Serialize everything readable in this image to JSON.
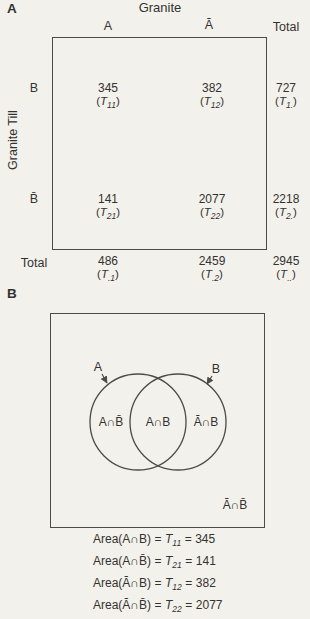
{
  "colors": {
    "paper": "#f3f1ec",
    "ink": "#343230",
    "line": "#4e4b46"
  },
  "panelA": {
    "label": "A",
    "title": "Granite",
    "col_headers": {
      "a": "A",
      "a_bar": "Ā",
      "total": "Total"
    },
    "row_axis_label": "Granite Till",
    "rows": [
      {
        "header": "B",
        "cells": [
          {
            "value": "345",
            "t_sub": "11"
          },
          {
            "value": "382",
            "t_sub": "12"
          },
          {
            "value": "727",
            "t_sub": "1."
          }
        ]
      },
      {
        "header": "B̄",
        "cells": [
          {
            "value": "141",
            "t_sub": "21"
          },
          {
            "value": "2077",
            "t_sub": "22"
          },
          {
            "value": "2218",
            "t_sub": "2."
          }
        ]
      },
      {
        "header": "Total",
        "cells": [
          {
            "value": "486",
            "t_sub": ".1"
          },
          {
            "value": "2459",
            "t_sub": ".2"
          },
          {
            "value": "2945",
            "t_sub": ".."
          }
        ]
      }
    ]
  },
  "panelB": {
    "label": "B",
    "set_a_label": "A",
    "set_b_label": "B",
    "regions": {
      "a_only": "A∩B̄",
      "intersection": "A∩B",
      "b_only": "Ā∩B",
      "outside": "Ā∩B̄"
    },
    "equations": [
      {
        "lhs": "Area(A∩B)",
        "t_sub": "11",
        "value": "345"
      },
      {
        "lhs": "Area(A∩B̄)",
        "t_sub": "21",
        "value": "141"
      },
      {
        "lhs": "Area(Ā∩B)",
        "t_sub": "12",
        "value": "382"
      },
      {
        "lhs": "Area(Ā∩B̄)",
        "t_sub": "22",
        "value": "2077"
      }
    ]
  },
  "symbols": {
    "open": "(",
    "close": ")",
    "t": "T",
    "equals": "="
  }
}
